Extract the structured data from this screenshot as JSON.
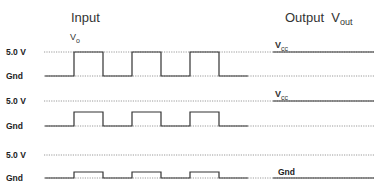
{
  "header": {
    "input_title": "Input",
    "input_signal": "V",
    "input_signal_sub": "o",
    "output_title": "Output  V",
    "output_title_sub": "out"
  },
  "colors": {
    "trace": "#333333",
    "reference_line": "#9a9a9a",
    "background": "#ffffff"
  },
  "rows": [
    {
      "high_label": "5.0 V",
      "low_label": "Gnd",
      "pulse_amplitude": "full (5.0 V)",
      "output_label": "V",
      "output_label_sub": "cc",
      "output_level": "high"
    },
    {
      "high_label": "5.0 V",
      "low_label": "Gnd",
      "pulse_amplitude": "partial (~half)",
      "output_label": "V",
      "output_label_sub": "cc",
      "output_level": "high"
    },
    {
      "high_label": "5.0 V",
      "low_label": "Gnd",
      "pulse_amplitude": "small (~quarter)",
      "output_label": "Gnd",
      "output_label_sub": "",
      "output_level": "low"
    }
  ],
  "pulses": {
    "count": 3,
    "edges_x": [
      [
        74,
        103
      ],
      [
        132,
        161
      ],
      [
        190,
        219
      ]
    ]
  }
}
